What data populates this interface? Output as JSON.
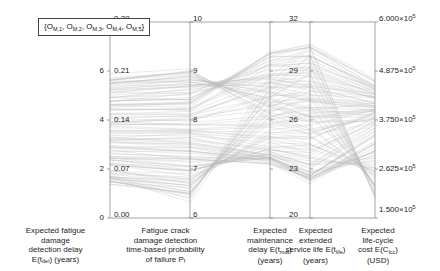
{
  "chart_data": {
    "type": "line",
    "subtype": "parallel-coordinates",
    "title": "",
    "legend": {
      "position": "top-left-inside",
      "entries": [
        "{O_M,1, O_M,2, O_M,3, O_M,4, O_M,5}"
      ],
      "objectives": [
        "O_M,1",
        "O_M,2",
        "O_M,3",
        "O_M,4",
        "O_M,5"
      ]
    },
    "grid": false,
    "line_color": "#b9b9b9",
    "n_lines": 120,
    "axes": [
      {
        "index": 1,
        "name": "expected-fatigue-damage-detection-delay",
        "label_lines": [
          "Expected fatigue",
          "damage",
          "detection delay",
          "E(t_del) (years)"
        ],
        "label_plain": "Expected fatigue damage detection delay E(t_del) (years)",
        "units": "years",
        "ticks": [
          "0",
          "2",
          "4",
          "6",
          "8"
        ],
        "tick_values": [
          0,
          2,
          4,
          6,
          8
        ],
        "range": [
          0,
          8
        ],
        "tick_side": "left"
      },
      {
        "index": 2,
        "name": "fatigue-crack-damage-detection-time-based-probability-of-failure",
        "label_lines": [
          "Fatigue crack",
          "damage detection",
          "time-based probability",
          "of failure P_f"
        ],
        "label_plain": "Fatigue crack damage detection time-based probability of failure P_f",
        "units": "",
        "ticks": [
          "0.00",
          "0.07",
          "0.14",
          "0.21",
          "0.28"
        ],
        "tick_values": [
          0.0,
          0.07,
          0.14,
          0.21,
          0.28
        ],
        "range": [
          0.0,
          0.28
        ],
        "tick_side": "inner"
      },
      {
        "index": 3,
        "name": "expected-maintenance-delay",
        "label_lines": [
          "Expected",
          "maintenance",
          "delay E(t_mdt)",
          "(years)"
        ],
        "label_plain": "Expected maintenance delay E(t_mdt) (years)",
        "units": "years",
        "ticks": [
          "6",
          "7",
          "8",
          "9",
          "10"
        ],
        "tick_values": [
          6,
          7,
          8,
          9,
          10
        ],
        "range": [
          6,
          10
        ],
        "tick_side": "inner"
      },
      {
        "index": 4,
        "name": "expected-extended-service-life",
        "label_lines": [
          "Expected",
          "extended",
          "service life E(t_life)",
          "(years)"
        ],
        "label_plain": "Expected extended service life E(t_life) (years)",
        "units": "years",
        "ticks": [
          "20",
          "23",
          "26",
          "29",
          "32"
        ],
        "tick_values": [
          20,
          23,
          26,
          29,
          32
        ],
        "range": [
          20,
          32
        ],
        "tick_side": "inner"
      },
      {
        "index": 5,
        "name": "expected-life-cycle-cost",
        "label_lines": [
          "Expected",
          "life-cycle",
          "cost E(C_lcc)",
          "(USD)"
        ],
        "label_plain": "Expected life-cycle cost E(C_lcc) (USD)",
        "units": "USD",
        "ticks": [
          "1.500×10⁵",
          "2.625×10⁵",
          "3.750×10⁵",
          "4.875×10⁵",
          "6.000×10⁵"
        ],
        "tick_mantissas": [
          "1.500",
          "2.625",
          "3.750",
          "4.875",
          "6.000"
        ],
        "tick_values": [
          150000,
          262500,
          375000,
          487500,
          600000
        ],
        "range": [
          150000,
          600000
        ],
        "tick_side": "right"
      }
    ],
    "series": [
      {
        "name": "solution",
        "values": [
          5.8,
          0.212,
          8.05,
          25.2,
          372000
        ]
      },
      {
        "name": "solution",
        "values": [
          5.72,
          0.209,
          8.15,
          25.6,
          378000
        ]
      },
      {
        "name": "solution",
        "values": [
          5.64,
          0.206,
          8.25,
          26.0,
          384000
        ]
      },
      {
        "name": "solution",
        "values": [
          5.56,
          0.203,
          8.35,
          26.4,
          390000
        ]
      },
      {
        "name": "solution",
        "values": [
          5.48,
          0.2,
          8.45,
          26.8,
          396000
        ]
      },
      {
        "name": "solution",
        "values": [
          5.4,
          0.196,
          8.55,
          27.2,
          402000
        ]
      },
      {
        "name": "solution",
        "values": [
          5.32,
          0.193,
          8.65,
          27.6,
          408000
        ]
      },
      {
        "name": "solution",
        "values": [
          5.24,
          0.19,
          8.75,
          28.0,
          414000
        ]
      },
      {
        "name": "solution",
        "values": [
          5.16,
          0.186,
          8.85,
          28.4,
          420000
        ]
      },
      {
        "name": "solution",
        "values": [
          5.08,
          0.183,
          8.95,
          28.8,
          426000
        ]
      },
      {
        "name": "solution",
        "values": [
          5.0,
          0.18,
          9.05,
          29.2,
          432000
        ]
      },
      {
        "name": "solution",
        "values": [
          4.9,
          0.176,
          9.15,
          29.6,
          440000
        ]
      },
      {
        "name": "solution",
        "values": [
          4.8,
          0.172,
          9.25,
          30.0,
          448000
        ]
      },
      {
        "name": "solution",
        "values": [
          4.7,
          0.168,
          9.35,
          30.4,
          456000
        ]
      },
      {
        "name": "solution",
        "values": [
          4.6,
          0.164,
          9.4,
          30.7,
          464000
        ]
      },
      {
        "name": "solution",
        "values": [
          4.5,
          0.16,
          9.3,
          30.2,
          458000
        ]
      },
      {
        "name": "solution",
        "values": [
          4.4,
          0.156,
          9.1,
          29.6,
          450000
        ]
      },
      {
        "name": "solution",
        "values": [
          4.3,
          0.152,
          8.9,
          29.0,
          442000
        ]
      },
      {
        "name": "solution",
        "values": [
          4.2,
          0.148,
          8.7,
          28.4,
          434000
        ]
      },
      {
        "name": "solution",
        "values": [
          4.1,
          0.144,
          8.5,
          27.8,
          426000
        ]
      },
      {
        "name": "solution",
        "values": [
          4.0,
          0.14,
          8.3,
          27.2,
          418000
        ]
      },
      {
        "name": "solution",
        "values": [
          3.9,
          0.136,
          8.1,
          26.6,
          410000
        ]
      },
      {
        "name": "solution",
        "values": [
          3.8,
          0.132,
          7.95,
          26.0,
          402000
        ]
      },
      {
        "name": "solution",
        "values": [
          3.7,
          0.128,
          7.8,
          25.4,
          394000
        ]
      },
      {
        "name": "solution",
        "values": [
          3.6,
          0.124,
          7.65,
          24.8,
          386000
        ]
      },
      {
        "name": "solution",
        "values": [
          3.5,
          0.12,
          7.5,
          24.2,
          378000
        ]
      },
      {
        "name": "solution",
        "values": [
          3.4,
          0.116,
          7.4,
          23.8,
          370000
        ]
      },
      {
        "name": "solution",
        "values": [
          3.3,
          0.112,
          7.3,
          23.4,
          362000
        ]
      },
      {
        "name": "solution",
        "values": [
          3.2,
          0.108,
          7.25,
          23.0,
          354000
        ]
      },
      {
        "name": "solution",
        "values": [
          3.1,
          0.104,
          7.2,
          22.7,
          346000
        ]
      },
      {
        "name": "solution",
        "values": [
          3.0,
          0.1,
          7.18,
          22.5,
          338000
        ]
      },
      {
        "name": "solution",
        "values": [
          2.9,
          0.096,
          7.16,
          22.4,
          330000
        ]
      },
      {
        "name": "solution",
        "values": [
          2.8,
          0.092,
          7.15,
          22.3,
          322000
        ]
      },
      {
        "name": "solution",
        "values": [
          2.7,
          0.088,
          7.15,
          22.3,
          314000
        ]
      },
      {
        "name": "solution",
        "values": [
          2.6,
          0.084,
          7.16,
          22.4,
          306000
        ]
      },
      {
        "name": "solution",
        "values": [
          2.5,
          0.08,
          7.18,
          22.5,
          298000
        ]
      },
      {
        "name": "solution",
        "values": [
          2.4,
          0.076,
          7.22,
          22.8,
          290000
        ]
      },
      {
        "name": "solution",
        "values": [
          2.3,
          0.072,
          7.28,
          23.1,
          282000
        ]
      },
      {
        "name": "solution",
        "values": [
          2.2,
          0.068,
          7.35,
          23.5,
          274000
        ]
      },
      {
        "name": "solution",
        "values": [
          2.1,
          0.064,
          7.45,
          24.0,
          266000
        ]
      },
      {
        "name": "solution",
        "values": [
          2.0,
          0.06,
          7.55,
          24.5,
          258000
        ]
      },
      {
        "name": "solution",
        "values": [
          1.9,
          0.056,
          7.68,
          25.1,
          250000
        ]
      },
      {
        "name": "solution",
        "values": [
          1.8,
          0.052,
          7.82,
          25.8,
          242000
        ]
      },
      {
        "name": "solution",
        "values": [
          1.7,
          0.048,
          7.96,
          26.5,
          234000
        ]
      },
      {
        "name": "solution",
        "values": [
          1.6,
          0.044,
          8.1,
          27.2,
          226000
        ]
      },
      {
        "name": "solution",
        "values": [
          1.55,
          0.04,
          8.25,
          27.9,
          220000
        ]
      },
      {
        "name": "solution",
        "values": [
          1.52,
          0.036,
          8.4,
          28.6,
          214000
        ]
      },
      {
        "name": "solution",
        "values": [
          1.5,
          0.032,
          8.55,
          29.3,
          208000
        ]
      },
      {
        "name": "solution",
        "values": [
          1.52,
          0.028,
          8.7,
          30.0,
          204000
        ]
      },
      {
        "name": "solution",
        "values": [
          1.56,
          0.024,
          8.85,
          30.6,
          200000
        ]
      }
    ]
  },
  "axis_geometry": {
    "x_positions": [
      110,
      190,
      270,
      310,
      375
    ],
    "y_top": 22,
    "y_bottom": 218
  }
}
